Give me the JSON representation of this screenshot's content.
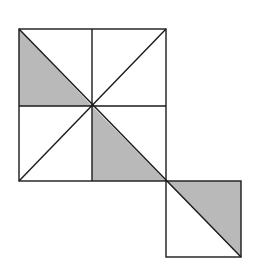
{
  "figure": {
    "colors": {
      "stroke": "#1a1a1a",
      "shade": "#b9b9b9",
      "background": "#ffffff"
    },
    "large_square": {
      "x": 19,
      "y": 29,
      "size": 147
    },
    "small_square": {
      "x": 166,
      "y": 181,
      "size": 75
    },
    "shaded_triangles": [
      {
        "name": "top-left-quadrant-lower-triangle",
        "points": "19,29 19,106 92,106"
      },
      {
        "name": "bottom-right-quadrant-lower-triangle",
        "points": "92,106 92,181 166,181"
      },
      {
        "name": "small-square-upper-triangle",
        "points": "166,181 241,181 241,257"
      }
    ]
  }
}
